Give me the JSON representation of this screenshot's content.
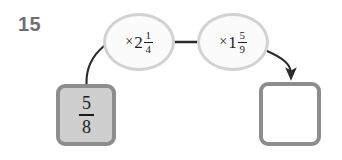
{
  "problem": {
    "number": "15"
  },
  "diagram": {
    "type": "function-machine-flow",
    "input_box": {
      "label": "5/8",
      "numerator": "5",
      "denominator": "8",
      "fill_color": "#cfcfcf",
      "border_color": "#8d8d8d"
    },
    "operations": [
      {
        "id": "op1",
        "operator": "×",
        "operator_name": "multiplication-sign",
        "whole": "2",
        "numerator": "1",
        "denominator": "4",
        "label": "× 2 1/4",
        "fill_color": "#fbfbfb",
        "border_color": "#d2d2d2"
      },
      {
        "id": "op2",
        "operator": "×",
        "operator_name": "multiplication-sign",
        "whole": "1",
        "numerator": "5",
        "denominator": "9",
        "label": "× 1 5/9",
        "fill_color": "#fbfbfb",
        "border_color": "#d2d2d2"
      }
    ],
    "answer_box": {
      "label": "",
      "fill_color": "#ffffff",
      "border_color": "#8d8d8d"
    },
    "connectors": [
      {
        "name": "input-to-op1-curve",
        "from": "input_box",
        "to": "op1",
        "arrowhead": false,
        "color": "#2b2b2b"
      },
      {
        "name": "op1-to-op2-line",
        "from": "op1",
        "to": "op2",
        "arrowhead": false,
        "color": "#2b2b2b"
      },
      {
        "name": "op2-to-answer-arrow",
        "from": "op2",
        "to": "answer_box",
        "arrowhead": true,
        "color": "#2b2b2b"
      }
    ]
  },
  "colors": {
    "page_background": "#ffffff",
    "number_text": "#6f6f73",
    "math_text": "#1d1d1d",
    "connector": "#2b2b2b"
  }
}
